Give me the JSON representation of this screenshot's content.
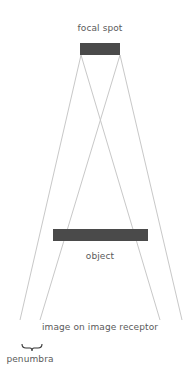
{
  "labels": {
    "focal_spot": "focal spot",
    "object": "object",
    "image_receptor": "image on image receptor",
    "penumbra": "penumbra"
  },
  "colors": {
    "bar": "#4a4a4a",
    "ray": "#c8c8c8",
    "text": "#5a5a5a",
    "brace": "#333333"
  },
  "geometry": {
    "focal_spot_bar": {
      "x": 80,
      "y": 43,
      "width": 40,
      "height": 12
    },
    "object_bar": {
      "x": 53,
      "y": 229,
      "width": 95,
      "height": 12
    },
    "rays": [
      {
        "from": [
          81,
          55
        ],
        "to": [
          20,
          320
        ]
      },
      {
        "from": [
          81,
          55
        ],
        "to": [
          160,
          320
        ]
      },
      {
        "from": [
          120,
          55
        ],
        "to": [
          40,
          320
        ]
      },
      {
        "from": [
          120,
          55
        ],
        "to": [
          182,
          320
        ]
      }
    ],
    "penumbra_brace": {
      "x1": 22,
      "x2": 42,
      "y": 348
    }
  }
}
